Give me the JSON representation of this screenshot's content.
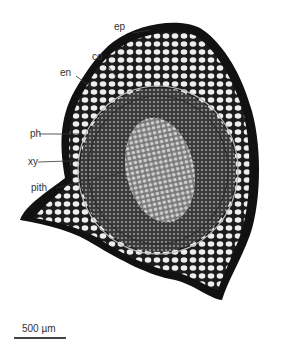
{
  "figure": {
    "labels": [
      {
        "id": "ep",
        "text": "ep"
      },
      {
        "id": "co",
        "text": "co"
      },
      {
        "id": "en",
        "text": "en"
      },
      {
        "id": "ph",
        "text": "ph"
      },
      {
        "id": "xy",
        "text": "xy"
      },
      {
        "id": "pith",
        "text": "pith"
      }
    ],
    "scale_bar": {
      "text": "500 µm"
    }
  }
}
